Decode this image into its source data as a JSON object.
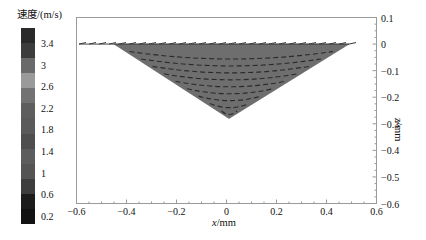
{
  "chart_data": {
    "type": "vector-field",
    "title": "",
    "xlabel": "x/mm",
    "ylabel": "z/mm",
    "xlim": [
      -0.6,
      0.6
    ],
    "ylim": [
      -0.6,
      0.1
    ],
    "x_ticks": [
      "-0.6",
      "-0.4",
      "-0.2",
      "0",
      "0.2",
      "0.4",
      "0.6"
    ],
    "z_ticks": [
      "0.1",
      "0",
      "-0.1",
      "-0.2",
      "-0.3",
      "-0.4",
      "-0.5",
      "-0.6"
    ],
    "grid": false,
    "region": {
      "shape": "triangle",
      "vertices": [
        [
          -0.45,
          0.0
        ],
        [
          0.49,
          0.0
        ],
        [
          0.01,
          -0.28
        ]
      ],
      "fill": "#6e6e6e"
    },
    "surface_arrows": {
      "x_start": -0.59,
      "x_end": 0.49,
      "z": 0.0,
      "direction": "outward"
    },
    "flow": "two circulation cells converging toward center, arrows along streamlines",
    "colorbar": {
      "title": "速度/(m/s)",
      "ticks": [
        "3.4",
        "3",
        "2.6",
        "2.2",
        "1.8",
        "1.4",
        "1",
        "0.6",
        "0.2"
      ],
      "range": [
        0.0,
        3.6
      ],
      "position": "left"
    }
  },
  "colorbar": {
    "title": "速度/(m/s)",
    "ticks": [
      "3.4",
      "3",
      "2.6",
      "2.2",
      "1.8",
      "1.4",
      "1",
      "0.6",
      "0.2"
    ],
    "segments": [
      "#2a2a2a",
      "#3c3c3c",
      "#6a6a6a",
      "#9a9a9a",
      "#727272",
      "#5e5e5e",
      "#5a5a5a",
      "#4e4e4e",
      "#5c5c5c",
      "#545454",
      "#3e3e3e",
      "#1c1c1c",
      "#121212"
    ]
  },
  "axes": {
    "xlabel_italic": "x",
    "xlabel_unit": "/mm",
    "zlabel_italic": "z",
    "zlabel_unit": "/mm",
    "x_ticks": [
      "−0.6",
      "−0.4",
      "−0.2",
      "0",
      "0.2",
      "0.4",
      "0.6"
    ],
    "z_ticks": [
      "0.1",
      "0",
      "−0.1",
      "−0.2",
      "−0.3",
      "−0.4",
      "−0.5",
      "−0.6"
    ]
  }
}
